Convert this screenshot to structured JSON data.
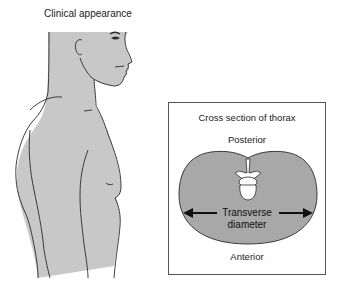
{
  "clinical": {
    "title": "Clinical appearance"
  },
  "cross_section": {
    "title": "Cross section of thorax",
    "posterior_label": "Posterior",
    "anterior_label": "Anterior",
    "diameter_label_line1": "Transverse",
    "diameter_label_line2": "diameter"
  },
  "colors": {
    "skin_fill": "#c8c8c8",
    "outline": "#2a2a2a",
    "thorax_fill": "#a8a8a8",
    "vertebra_fill": "#ffffff",
    "box_border": "#555555"
  },
  "icons": {
    "left_arrow": "arrow-left-icon",
    "right_arrow": "arrow-right-icon"
  }
}
